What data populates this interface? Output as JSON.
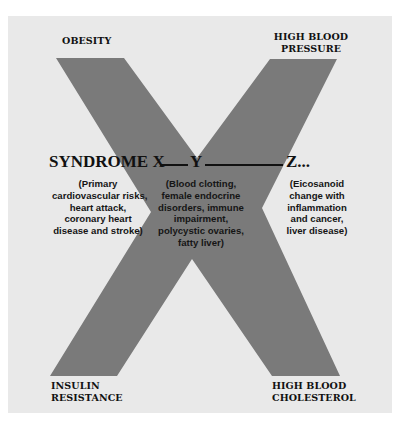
{
  "diagram": {
    "colors": {
      "background": "#ffffff",
      "panel": "#e9e9e9",
      "x_shape": "#7a7a7a",
      "text": "#111111"
    },
    "corners": {
      "top_left": [
        "OBESITY"
      ],
      "top_right": [
        "HIGH BLOOD",
        "PRESSURE"
      ],
      "bottom_left": [
        "INSULIN",
        "RESISTANCE"
      ],
      "bottom_right": [
        "HIGH BLOOD",
        "CHOLESTEROL"
      ]
    },
    "heading": {
      "syndrome_x": "SYNDROME X",
      "y": "Y",
      "z": "Z..."
    },
    "descriptions": {
      "x": [
        "(Primary",
        "cardiovascular risks,",
        "heart attack,",
        "coronary heart",
        "disease and stroke)"
      ],
      "y": [
        "(Blood clotting,",
        "female endocrine",
        "disorders, immune",
        "impairment,",
        "polycystic ovaries,",
        "fatty liver)"
      ],
      "z": [
        "(Eicosanoid",
        "change with",
        "inflammation",
        "and cancer,",
        "liver disease)"
      ]
    }
  }
}
